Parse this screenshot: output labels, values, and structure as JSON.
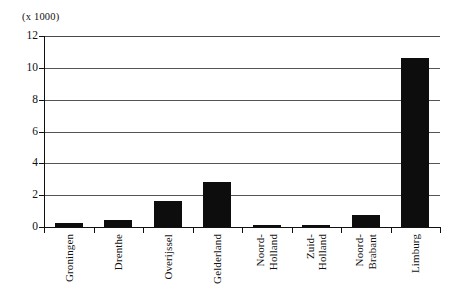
{
  "chart_data": {
    "type": "bar",
    "title": "",
    "subtitle": "",
    "unit_label": "(x 1000)",
    "xlabel": "",
    "ylabel": "",
    "ylim": [
      0,
      12
    ],
    "y_ticks": [
      0,
      2,
      4,
      6,
      8,
      10,
      12
    ],
    "y_tick_labels": [
      "0",
      "2",
      "4",
      "6",
      "8",
      "10",
      "12"
    ],
    "grid": true,
    "grid_axis": "y",
    "legend": false,
    "legend_position": "none",
    "bar_color": "#0d0d0d",
    "background_color": "#ffffff",
    "axis_color": "#111111",
    "categories": [
      "Groningen",
      "Drenthe",
      "Overijssel",
      "Gelderland",
      "Noord-Holland",
      "Zuid-Holland",
      "Noord-Brabant",
      "Limburg"
    ],
    "category_lines": [
      [
        "Groningen"
      ],
      [
        "Drenthe"
      ],
      [
        "Overijssel"
      ],
      [
        "Gelderland"
      ],
      [
        "Noord-",
        "Holland"
      ],
      [
        "Zuid-",
        "Holland"
      ],
      [
        "Noord-",
        "Brabant"
      ],
      [
        "Limburg"
      ]
    ],
    "values": [
      0.25,
      0.45,
      1.65,
      2.8,
      0.15,
      0.15,
      0.75,
      10.6
    ]
  }
}
